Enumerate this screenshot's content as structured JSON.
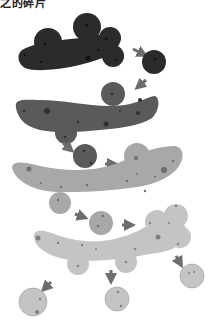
{
  "caption": "之的碎片",
  "colors": {
    "stage1": "#2b2b2b",
    "stage1_spot": "#111111",
    "stage2": "#5a5a5a",
    "stage2_spot": "#303030",
    "stage3": "#a8a8a8",
    "stage3_spot": "#6e6e6e",
    "stage4": "#c4c4c4",
    "stage4_spot": "#808080",
    "arrow": "#6d6d6d"
  },
  "diagram": {
    "stages": [
      {
        "label": "stage-1",
        "shade": "dark",
        "fragments": 1
      },
      {
        "label": "stage-2",
        "shade": "medium-dark",
        "fragments": 1
      },
      {
        "label": "stage-3",
        "shade": "light",
        "fragments": 1
      },
      {
        "label": "stage-4",
        "shade": "lightest",
        "fragments": 3
      }
    ]
  }
}
